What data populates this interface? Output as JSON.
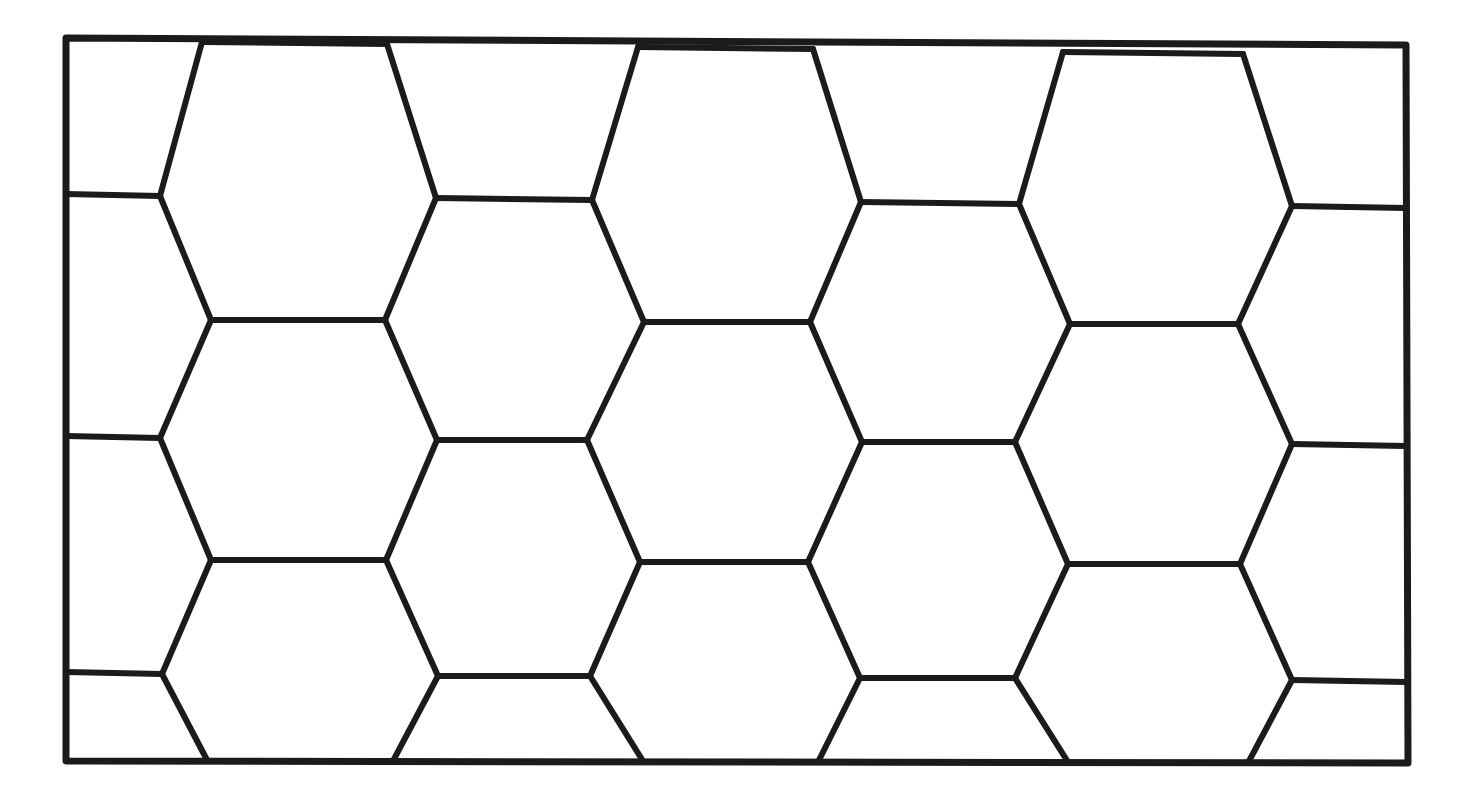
{
  "figure": {
    "medium": "ink on paper",
    "background_color": "#fdfdfb",
    "ink_color": "#1b1b1b",
    "canvas": {
      "width": 1463,
      "height": 797
    }
  },
  "border": {
    "name": "rectangular-frame",
    "stroke_width": 6,
    "corners": {
      "top_left": [
        66,
        38
      ],
      "top_right": [
        1406,
        45
      ],
      "bottom_right": [
        1408,
        763
      ],
      "bottom_left": [
        66,
        761
      ]
    }
  },
  "lattice": {
    "orientation": "flat-top",
    "column_pitch": 250,
    "row_pitch": 243,
    "flat_edge_length": 186,
    "slant_run": 65,
    "slant_rise": 122,
    "stroke_width": 6,
    "row_boundaries_y": [
      38,
      197,
      320,
      440,
      560,
      675,
      763
    ],
    "top_edge_junctions_x": [
      202,
      387,
      638,
      813,
      1063,
      1243
    ],
    "bottom_edge_junctions_x": [
      207,
      393,
      643,
      818,
      1068,
      1248
    ],
    "mid_vertex_x": [
      437,
      587,
      687,
      837,
      937,
      1087
    ],
    "full_hexagon_count": 12,
    "partial_cells_count": 14
  },
  "hexagons": [
    {
      "id": "hex-r1-c1",
      "cx": 295,
      "cy": 135,
      "clipped": "top"
    },
    {
      "id": "hex-r1-c2",
      "cx": 545,
      "cy": 135,
      "clipped": "top"
    },
    {
      "id": "hex-r1-c3",
      "cx": 795,
      "cy": 135,
      "clipped": "top"
    },
    {
      "id": "hex-r1-c4",
      "cx": 1045,
      "cy": 135,
      "clipped": "top"
    },
    {
      "id": "hex-r1-c5",
      "cx": 1295,
      "cy": 135,
      "clipped": "top-right"
    },
    {
      "id": "hex-r2-c1",
      "cx": 170,
      "cy": 318,
      "clipped": "left"
    },
    {
      "id": "hex-r2-c2",
      "cx": 420,
      "cy": 318,
      "clipped": "none"
    },
    {
      "id": "hex-r2-c3",
      "cx": 670,
      "cy": 318,
      "clipped": "none"
    },
    {
      "id": "hex-r2-c4",
      "cx": 920,
      "cy": 318,
      "clipped": "none"
    },
    {
      "id": "hex-r2-c5",
      "cx": 1170,
      "cy": 318,
      "clipped": "none"
    },
    {
      "id": "hex-r3-c1",
      "cx": 295,
      "cy": 500,
      "clipped": "none"
    },
    {
      "id": "hex-r3-c2",
      "cx": 545,
      "cy": 500,
      "clipped": "none"
    },
    {
      "id": "hex-r3-c3",
      "cx": 795,
      "cy": 500,
      "clipped": "none"
    },
    {
      "id": "hex-r3-c4",
      "cx": 1045,
      "cy": 500,
      "clipped": "none"
    },
    {
      "id": "hex-r3-c5",
      "cx": 1295,
      "cy": 500,
      "clipped": "right"
    },
    {
      "id": "hex-r4-c1",
      "cx": 170,
      "cy": 683,
      "clipped": "left-bottom"
    },
    {
      "id": "hex-r4-c2",
      "cx": 420,
      "cy": 683,
      "clipped": "bottom"
    },
    {
      "id": "hex-r4-c3",
      "cx": 670,
      "cy": 683,
      "clipped": "bottom"
    },
    {
      "id": "hex-r4-c4",
      "cx": 920,
      "cy": 683,
      "clipped": "bottom"
    },
    {
      "id": "hex-r4-c5",
      "cx": 1170,
      "cy": 683,
      "clipped": "bottom"
    }
  ],
  "chart_data": {
    "type": "diagram",
    "xlabel": "",
    "ylabel": "",
    "categories": [],
    "values": []
  }
}
